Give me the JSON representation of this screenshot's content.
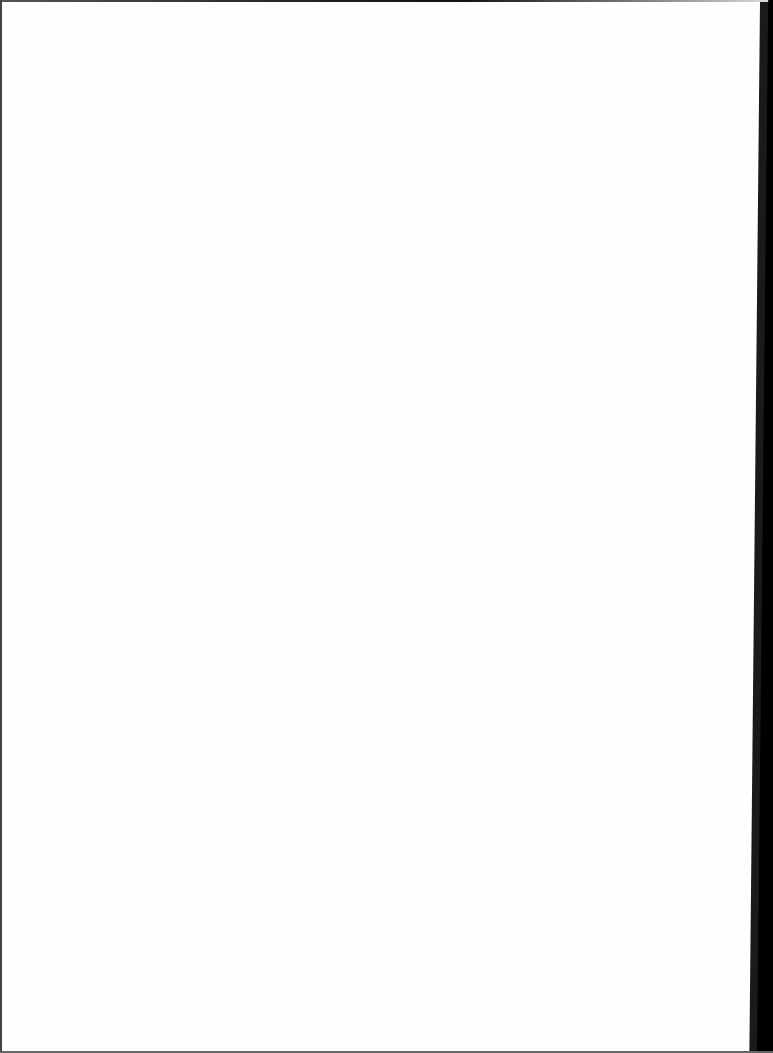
{
  "document": {
    "type": "blank-scanned-page",
    "content": "",
    "colors": {
      "paper": "#fefefd",
      "border": "#000000"
    }
  }
}
